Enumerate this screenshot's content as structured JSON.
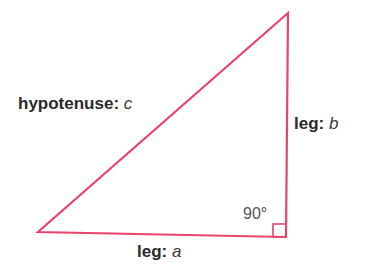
{
  "diagram": {
    "line_color": "#e8456e",
    "text_color": "#2a2a2a",
    "angle_text_color": "#555555",
    "vertices": {
      "top": {
        "x": 288,
        "y": 13
      },
      "bottom_left": {
        "x": 38,
        "y": 232
      },
      "right_angle": {
        "x": 286,
        "y": 237
      }
    },
    "right_angle_marker_size": 13,
    "labels": {
      "hypotenuse": {
        "term": "hypotenuse:",
        "var": "c"
      },
      "leg_b": {
        "term": "leg:",
        "var": "b"
      },
      "leg_a": {
        "term": "leg:",
        "var": "a"
      },
      "angle": "90°"
    }
  }
}
